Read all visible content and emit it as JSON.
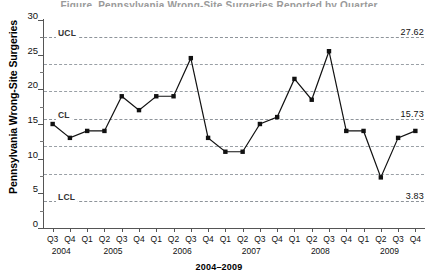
{
  "title_clipped": "Figure. Pennsylvania Wrong-Site Surgeries Reported by Quarter",
  "axis": {
    "ylabel": "Pennsylvania Wrong-Site Surgeries",
    "xlabel": "2004–2009",
    "yticks": [
      0,
      5,
      10,
      15,
      20,
      25,
      30
    ],
    "ylim": [
      0,
      30
    ],
    "ytick_minor": [
      2.5,
      7.5,
      12.5,
      17.5,
      22.5,
      27.5
    ]
  },
  "control_limits": {
    "ucl": {
      "label": "UCL",
      "value": 27.62,
      "value_text": "27.62"
    },
    "cl": {
      "label": "CL",
      "value": 15.73,
      "value_text": "15.73"
    },
    "lcl": {
      "label": "LCL",
      "value": 3.83,
      "value_text": "3.83"
    },
    "sigma_zones": [
      23.65,
      19.69,
      11.77,
      7.8
    ]
  },
  "chart_data": {
    "type": "line",
    "title": "Pennsylvania Wrong-Site Surgeries Reported by Quarter",
    "xlabel": "2004–2009",
    "ylabel": "Pennsylvania Wrong-Site Surgeries",
    "ylim": [
      0,
      30
    ],
    "yticks": [
      0,
      5,
      10,
      15,
      20,
      25,
      30
    ],
    "grid": true,
    "legend": "none",
    "marker": "filled-square",
    "categories": [
      "Q3 2004",
      "Q4 2004",
      "Q1 2005",
      "Q2 2005",
      "Q3 2005",
      "Q4 2005",
      "Q1 2006",
      "Q2 2006",
      "Q3 2006",
      "Q4 2006",
      "Q1 2007",
      "Q2 2007",
      "Q3 2007",
      "Q4 2007",
      "Q1 2008",
      "Q2 2008",
      "Q3 2008",
      "Q4 2008",
      "Q1 2009",
      "Q2 2009",
      "Q3 2009",
      "Q4 2009"
    ],
    "quarters": [
      "Q3",
      "Q4",
      "Q1",
      "Q2",
      "Q3",
      "Q4",
      "Q1",
      "Q2",
      "Q3",
      "Q4",
      "Q1",
      "Q2",
      "Q3",
      "Q4",
      "Q1",
      "Q2",
      "Q3",
      "Q4",
      "Q1",
      "Q2",
      "Q3",
      "Q4"
    ],
    "year_groups": [
      {
        "year": "2004",
        "start_index": 0,
        "span": 2
      },
      {
        "year": "2005",
        "start_index": 2,
        "span": 4
      },
      {
        "year": "2006",
        "start_index": 6,
        "span": 4
      },
      {
        "year": "2007",
        "start_index": 10,
        "span": 4
      },
      {
        "year": "2008",
        "start_index": 14,
        "span": 4
      },
      {
        "year": "2009",
        "start_index": 18,
        "span": 4
      }
    ],
    "values": [
      15,
      13,
      14,
      14,
      19,
      17,
      19,
      19,
      24.5,
      13,
      11,
      11,
      15,
      16,
      21.5,
      18.5,
      25.5,
      14,
      14,
      7.3,
      13,
      14
    ],
    "annotations": [
      {
        "label": "UCL",
        "value": 27.62,
        "value_text": "27.62"
      },
      {
        "label": "CL",
        "value": 15.73,
        "value_text": "15.73"
      },
      {
        "label": "LCL",
        "value": 3.83,
        "value_text": "3.83"
      }
    ]
  },
  "colors": {
    "series": "#111111",
    "gridline": "#9aa0a6",
    "axis": "#555555",
    "text": "#111111"
  }
}
